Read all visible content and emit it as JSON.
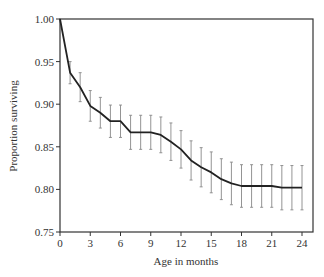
{
  "chart_data": {
    "type": "line",
    "title": "",
    "xlabel": "Age in months",
    "ylabel": "Proportion surviving",
    "xlim": [
      0,
      24
    ],
    "ylim": [
      0.75,
      1.0
    ],
    "xticks": [
      0,
      3,
      6,
      9,
      12,
      15,
      18,
      21,
      24
    ],
    "yticks": [
      0.75,
      0.8,
      0.85,
      0.9,
      0.95,
      1.0
    ],
    "ytick_labels": [
      "0.75",
      "0.80",
      "0.85",
      "0.90",
      "0.95",
      "1.00"
    ],
    "grid": false,
    "legend": null,
    "x": [
      0,
      1,
      2,
      3,
      4,
      5,
      6,
      7,
      8,
      9,
      10,
      11,
      12,
      13,
      14,
      15,
      16,
      17,
      18,
      19,
      20,
      21,
      22,
      23,
      24
    ],
    "series": [
      {
        "name": "Proportion surviving",
        "values": [
          1.0,
          0.937,
          0.92,
          0.898,
          0.89,
          0.88,
          0.88,
          0.867,
          0.867,
          0.867,
          0.864,
          0.856,
          0.847,
          0.834,
          0.826,
          0.82,
          0.812,
          0.807,
          0.804,
          0.804,
          0.804,
          0.804,
          0.802,
          0.802,
          0.802
        ],
        "error": [
          0,
          0.013,
          0.017,
          0.018,
          0.018,
          0.019,
          0.019,
          0.02,
          0.02,
          0.02,
          0.021,
          0.022,
          0.022,
          0.023,
          0.023,
          0.024,
          0.024,
          0.025,
          0.025,
          0.025,
          0.025,
          0.025,
          0.026,
          0.026,
          0.026
        ]
      }
    ]
  }
}
